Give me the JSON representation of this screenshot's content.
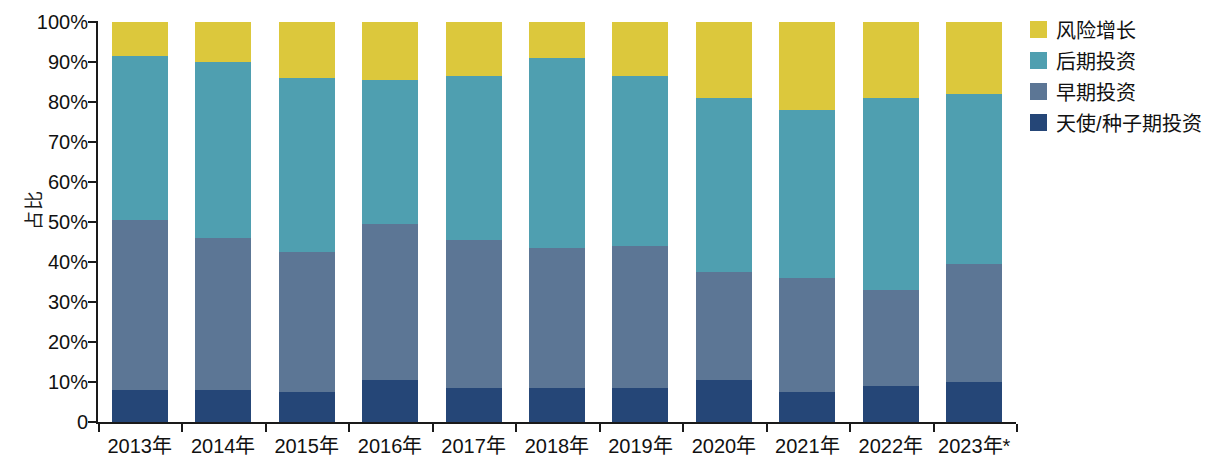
{
  "chart_data": {
    "type": "bar",
    "stacked": true,
    "stack_mode": "percent",
    "title": "",
    "subtitle": "",
    "xlabel": "",
    "ylabel": "占比",
    "ylim": [
      0,
      100
    ],
    "y_unit": "%",
    "grid": false,
    "legend_position": "right",
    "categories": [
      "2013年",
      "2014年",
      "2015年",
      "2016年",
      "2017年",
      "2018年",
      "2019年",
      "2020年",
      "2021年",
      "2022年",
      "2023年*"
    ],
    "y_ticks": [
      "0",
      "10%",
      "20%",
      "30%",
      "40%",
      "50%",
      "60%",
      "70%",
      "80%",
      "90%",
      "100%"
    ],
    "y_tick_values": [
      0,
      10,
      20,
      30,
      40,
      50,
      60,
      70,
      80,
      90,
      100
    ],
    "series": [
      {
        "name": "天使/种子期投资",
        "color": "#254677",
        "values": [
          8.0,
          8.0,
          7.5,
          10.5,
          8.5,
          8.5,
          8.5,
          10.5,
          7.5,
          9.0,
          10.0
        ]
      },
      {
        "name": "早期投资",
        "color": "#5c7695",
        "values": [
          42.5,
          38.0,
          35.0,
          39.0,
          37.0,
          35.0,
          35.5,
          27.0,
          28.5,
          24.0,
          29.5
        ]
      },
      {
        "name": "后期投资",
        "color": "#4f9fb0",
        "values": [
          41.0,
          44.0,
          43.5,
          36.0,
          41.0,
          47.5,
          42.5,
          43.5,
          42.0,
          48.0,
          42.5
        ]
      },
      {
        "name": "风险增长",
        "color": "#dcc83c",
        "values": [
          8.5,
          10.0,
          14.0,
          14.5,
          13.5,
          9.0,
          13.5,
          19.0,
          22.0,
          19.0,
          18.0
        ]
      }
    ],
    "stack_order_bottom_to_top": [
      "天使/种子期投资",
      "早期投资",
      "后期投资",
      "风险增长"
    ],
    "cumulative_tops": {
      "2013年": [
        8.0,
        50.5,
        91.5,
        100
      ],
      "2014年": [
        8.0,
        46.0,
        90.0,
        100
      ],
      "2015年": [
        7.5,
        42.5,
        86.0,
        100
      ],
      "2016年": [
        10.5,
        49.5,
        85.5,
        100
      ],
      "2017年": [
        8.5,
        45.5,
        86.5,
        100
      ],
      "2018年": [
        8.5,
        43.5,
        91.0,
        100
      ],
      "2019年": [
        8.5,
        44.0,
        86.5,
        100
      ],
      "2020年": [
        10.5,
        37.5,
        81.0,
        100
      ],
      "2021年": [
        7.5,
        36.0,
        78.0,
        100
      ],
      "2022年": [
        9.0,
        33.0,
        81.0,
        100
      ],
      "2023年*": [
        10.0,
        39.5,
        82.0,
        100
      ]
    }
  },
  "legend": {
    "items": [
      {
        "label": "风险增长",
        "color": "#dcc83c"
      },
      {
        "label": "后期投资",
        "color": "#4f9fb0"
      },
      {
        "label": "早期投资",
        "color": "#5c7695"
      },
      {
        "label": "天使/种子期投资",
        "color": "#254677"
      }
    ]
  },
  "axis": {
    "y_title": "占比",
    "axis_color": "#1a1a1a"
  }
}
